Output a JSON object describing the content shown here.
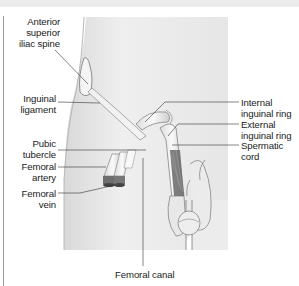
{
  "figure": {
    "colors": {
      "skin": "#ececec",
      "skin_shade": "#d6d6d6",
      "outline": "#7a7a7a",
      "leader": "#333333",
      "vessel_dark": "#6e6e6e",
      "cord_fill": "#5c5c5c"
    }
  },
  "labels": {
    "asis": "Anterior\nsuperior\niliac spine",
    "inguinal_ligament": "Inguinal\nligament",
    "pubic_tubercle": "Pubic\ntubercle",
    "femoral_artery": "Femoral\nartery",
    "femoral_vein": "Femoral\nvein",
    "femoral_canal": "Femoral canal",
    "internal_ring": "Internal\ninguinal ring",
    "external_ring": "External\ninguinal ring",
    "spermatic_cord": "Spermatic\ncord"
  }
}
